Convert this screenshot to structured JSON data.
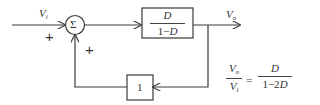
{
  "diagram": {
    "type": "block-diagram",
    "input_label": "V",
    "input_sub": "i",
    "output_label": "V",
    "output_sub": "o",
    "summing_junction": {
      "symbol": "Σ",
      "input_signs": [
        "+",
        "+"
      ]
    },
    "forward_block": {
      "numerator": "D",
      "denominator_prefix": "1−",
      "denominator_var": "D"
    },
    "feedback_block": {
      "gain": "1"
    },
    "transfer_function": {
      "lhs_num": "V",
      "lhs_num_sub": "o",
      "lhs_den": "V",
      "lhs_den_sub": "i",
      "equals": "=",
      "rhs_num": "D",
      "rhs_den_prefix": "1−2",
      "rhs_den_var": "D"
    },
    "colors": {
      "line": "#3a3a3a",
      "text": "#333333",
      "background": "#ffffff"
    }
  }
}
